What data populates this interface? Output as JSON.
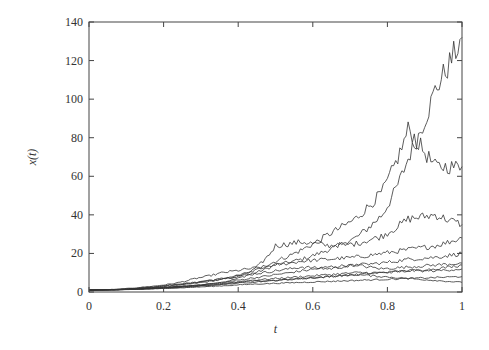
{
  "chart_data": {
    "type": "line",
    "title": "",
    "xlabel": "t",
    "ylabel": "x(t)",
    "xlim": [
      0,
      1
    ],
    "ylim": [
      0,
      140
    ],
    "xticks": [
      0,
      0.2,
      0.4,
      0.6,
      0.8,
      1
    ],
    "xtick_labels": [
      "0",
      "0.2",
      "0.4",
      "0.6",
      "0.8",
      "1"
    ],
    "yticks": [
      0,
      20,
      40,
      60,
      80,
      100,
      120,
      140
    ],
    "ytick_labels": [
      "0",
      "20",
      "40",
      "60",
      "80",
      "100",
      "120",
      "140"
    ],
    "grid": false,
    "legend": null,
    "line_color": "#333333",
    "x": [
      0,
      0.1,
      0.2,
      0.3,
      0.4,
      0.5,
      0.6,
      0.65,
      0.7,
      0.75,
      0.8,
      0.85,
      0.9,
      0.95,
      1.0
    ],
    "series": [
      {
        "name": "path-1",
        "values": [
          1,
          1.2,
          1.6,
          2.5,
          3.5,
          5,
          9,
          14,
          17,
          22,
          28,
          40,
          70,
          105,
          132
        ]
      },
      {
        "name": "path-2",
        "values": [
          1,
          1.3,
          2,
          3,
          4.5,
          6.5,
          10,
          16,
          22,
          30,
          38,
          52,
          85,
          65,
          65
        ]
      },
      {
        "name": "path-3",
        "values": [
          1,
          1.2,
          2.2,
          3.5,
          5,
          7,
          10,
          24,
          26,
          24,
          25,
          29,
          38,
          40,
          35
        ]
      },
      {
        "name": "path-4",
        "values": [
          1,
          1.4,
          2.5,
          4,
          7,
          10,
          12,
          14,
          16,
          17,
          18,
          20,
          22,
          24,
          28
        ]
      },
      {
        "name": "path-5",
        "values": [
          1,
          1.3,
          2,
          3.5,
          5,
          7,
          9,
          11,
          13,
          12,
          14,
          15,
          17,
          18,
          20
        ]
      },
      {
        "name": "path-6",
        "values": [
          1,
          1.2,
          1.8,
          2.5,
          3.5,
          5,
          7,
          9,
          11,
          13,
          14,
          12,
          13,
          14,
          15
        ]
      },
      {
        "name": "path-7",
        "values": [
          1,
          1.1,
          1.6,
          2.2,
          3,
          4,
          5,
          6,
          7,
          8,
          9,
          10,
          11,
          12,
          14
        ]
      },
      {
        "name": "path-8",
        "values": [
          1,
          1.2,
          1.7,
          2.4,
          3.2,
          4.5,
          6,
          7,
          8,
          9,
          10,
          10,
          11,
          11,
          12
        ]
      },
      {
        "name": "path-9",
        "values": [
          1,
          1.1,
          1.4,
          1.9,
          2.5,
          3.2,
          4,
          4.5,
          5,
          5.5,
          6,
          6.5,
          7,
          7.5,
          8
        ]
      },
      {
        "name": "path-10",
        "values": [
          1,
          1.2,
          1.6,
          2.2,
          3,
          4,
          5.5,
          6,
          7,
          8,
          9,
          8,
          7,
          6,
          5
        ]
      }
    ]
  },
  "plot_area": {
    "left": 89,
    "top": 22,
    "right": 462,
    "bottom": 292
  }
}
